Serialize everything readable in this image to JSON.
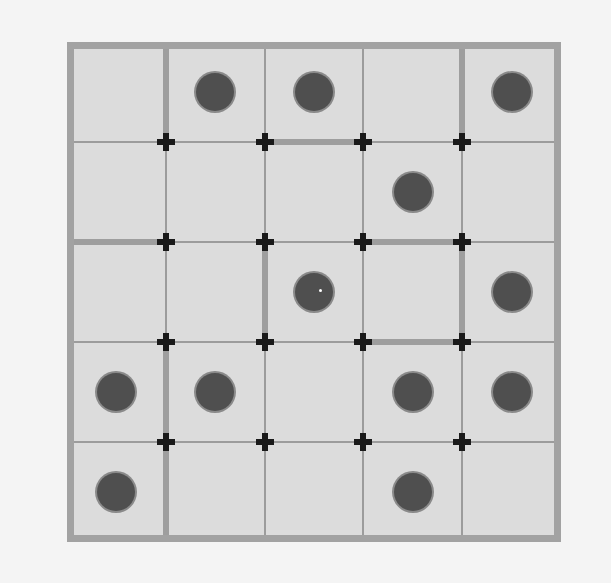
{
  "puzzle": {
    "rows": 5,
    "cols": 5,
    "colors": {
      "background": "#f4f4f4",
      "cell": "#dcdcdc",
      "grid_line": "#9c9c9c",
      "wall": "#9e9e9e",
      "dot": "#4f4f4f",
      "cross": "#1a1a1a"
    },
    "dots": [
      {
        "row": 0,
        "col": 1
      },
      {
        "row": 0,
        "col": 2
      },
      {
        "row": 0,
        "col": 4
      },
      {
        "row": 1,
        "col": 3
      },
      {
        "row": 2,
        "col": 2,
        "highlight": true
      },
      {
        "row": 2,
        "col": 4
      },
      {
        "row": 3,
        "col": 0
      },
      {
        "row": 3,
        "col": 1
      },
      {
        "row": 3,
        "col": 3
      },
      {
        "row": 3,
        "col": 4
      },
      {
        "row": 4,
        "col": 0
      },
      {
        "row": 4,
        "col": 3
      }
    ],
    "crosses": [
      {
        "r": 1,
        "c": 1
      },
      {
        "r": 1,
        "c": 2
      },
      {
        "r": 1,
        "c": 3
      },
      {
        "r": 1,
        "c": 4
      },
      {
        "r": 2,
        "c": 1
      },
      {
        "r": 2,
        "c": 2
      },
      {
        "r": 2,
        "c": 3
      },
      {
        "r": 2,
        "c": 4
      },
      {
        "r": 3,
        "c": 1
      },
      {
        "r": 3,
        "c": 2
      },
      {
        "r": 3,
        "c": 3
      },
      {
        "r": 3,
        "c": 4
      },
      {
        "r": 4,
        "c": 1
      },
      {
        "r": 4,
        "c": 2
      },
      {
        "r": 4,
        "c": 3
      },
      {
        "r": 4,
        "c": 4
      }
    ],
    "vertical_walls": [
      {
        "x": 1,
        "row": 0
      },
      {
        "x": 1,
        "row": 3
      },
      {
        "x": 1,
        "row": 4
      },
      {
        "x": 2,
        "row": 2
      },
      {
        "x": 4,
        "row": 0
      },
      {
        "x": 4,
        "row": 2
      }
    ],
    "horizontal_walls": [
      {
        "y": 1,
        "col": 2
      },
      {
        "y": 2,
        "col": 0
      },
      {
        "y": 2,
        "col": 3
      },
      {
        "y": 3,
        "col": 3
      }
    ]
  }
}
